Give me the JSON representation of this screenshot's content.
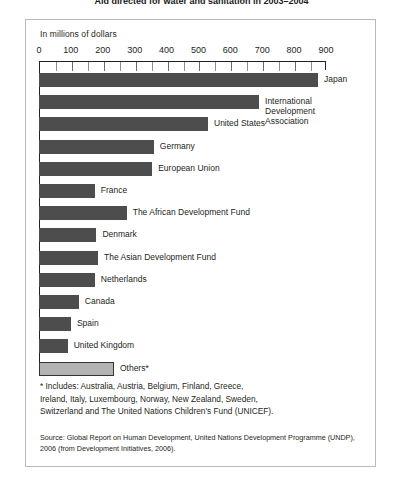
{
  "title": "Aid directed for water and sanitation in 2003–2004",
  "units_label": "In millions of dollars",
  "footnote": "* Includes: Australia, Austria, Belgium, Finland, Greece,\nIreland, Italy, Luxembourg, Norway, New Zealand, Sweden,\nSwitzerland and The United Nations Children's Fund (UNICEF).",
  "source": "Source: Global Report on Human Development, United Nations Development Programme (UNDP),\n          2006 (from Development Initiatives, 2006).",
  "colors": {
    "bar_dark": "#4d4d4d",
    "bar_light": "#b3b3b3",
    "frame": "#b9b9b9",
    "axis": "#231f20",
    "text": "#231f20",
    "background": "#ffffff"
  },
  "chart_data": {
    "type": "bar",
    "orientation": "horizontal",
    "title": "Aid directed for water and sanitation in 2003–2004",
    "xlabel": "In millions of dollars",
    "ylabel": "",
    "xlim": [
      0,
      900
    ],
    "xticks": [
      0,
      100,
      200,
      300,
      400,
      500,
      600,
      700,
      800,
      900
    ],
    "minor_tick_step": 50,
    "grid": false,
    "legend": "none",
    "categories": [
      "Japan",
      "International Development\nAssociation",
      "United States",
      "Germany",
      "European Union",
      "France",
      "The African Development Fund",
      "Denmark",
      "The Asian Development Fund",
      "Netherlands",
      "Canada",
      "Spain",
      "United Kingdom",
      "Others*"
    ],
    "values": [
      875,
      690,
      530,
      360,
      355,
      175,
      275,
      180,
      185,
      175,
      125,
      100,
      90,
      235
    ],
    "highlight_index": 13,
    "annotations": [
      "* Includes: Australia, Austria, Belgium, Finland, Greece, Ireland, Italy, Luxembourg, Norway, New Zealand, Sweden, Switzerland and The United Nations Children's Fund (UNICEF)."
    ]
  }
}
